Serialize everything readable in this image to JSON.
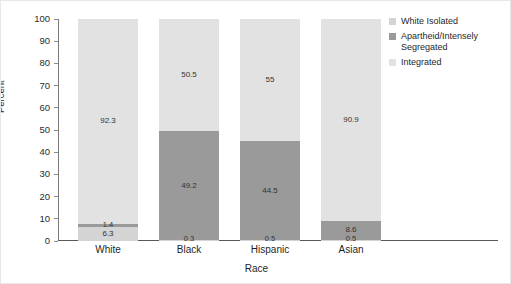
{
  "chart_data": {
    "type": "bar",
    "subtype": "stacked-bar-100",
    "title": "",
    "xlabel": "Race",
    "ylabel": "Percent",
    "ylim": [
      0,
      100
    ],
    "ytick_values": [
      0,
      10,
      20,
      30,
      40,
      50,
      60,
      70,
      80,
      90,
      100
    ],
    "ytick_labels": [
      "0",
      "10",
      "20",
      "30",
      "40",
      "50",
      "60",
      "70",
      "80",
      "90",
      "100"
    ],
    "grid": false,
    "legend_position": "right-top",
    "categories": [
      "White",
      "Black",
      "Hispanic",
      "Asian"
    ],
    "series": [
      {
        "name": "White Isolated",
        "color": "#d4d4d4",
        "values": [
          6.3,
          0.3,
          0.5,
          0.5
        ],
        "labels": [
          "6.3",
          "0.3",
          "0.5",
          "0.5"
        ]
      },
      {
        "name": "Apartheid/Intensely Segregated",
        "color": "#9a9a9a",
        "values": [
          1.4,
          49.2,
          44.5,
          8.6
        ],
        "labels": [
          "1.4",
          "49.2",
          "44.5",
          "8.6"
        ]
      },
      {
        "name": "Integrated",
        "color": "#e2e2e2",
        "values": [
          92.3,
          50.5,
          55.0,
          90.9
        ],
        "labels": [
          "92.3",
          "50.5",
          "55",
          "90.9"
        ]
      }
    ]
  },
  "axes": {
    "y_title": "Percent",
    "x_title": "Race",
    "y_ticks": [
      {
        "label": "100",
        "value": 100
      },
      {
        "label": "90",
        "value": 90
      },
      {
        "label": "80",
        "value": 80
      },
      {
        "label": "70",
        "value": 70
      },
      {
        "label": "60",
        "value": 60
      },
      {
        "label": "50",
        "value": 50
      },
      {
        "label": "40",
        "value": 40
      },
      {
        "label": "30",
        "value": 30
      },
      {
        "label": "20",
        "value": 20
      },
      {
        "label": "10",
        "value": 10
      },
      {
        "label": "0",
        "value": 0
      }
    ],
    "x_categories": [
      {
        "label": "White"
      },
      {
        "label": "Black"
      },
      {
        "label": "Hispanic"
      },
      {
        "label": "Asian"
      }
    ]
  },
  "legend": {
    "items": [
      {
        "label": "White Isolated",
        "color": "#d4d4d4"
      },
      {
        "label": "Apartheid/Intensely Segregated",
        "color": "#9a9a9a"
      },
      {
        "label": "Integrated",
        "color": "#e2e2e2"
      }
    ]
  },
  "bars": [
    {
      "category": "White",
      "segments": [
        {
          "series": "Integrated",
          "value": 92.3,
          "label": "92.3",
          "color": "#e2e2e2"
        },
        {
          "series": "Apartheid",
          "value": 1.4,
          "label": "1.4",
          "color": "#9a9a9a"
        },
        {
          "series": "WhiteIsolated",
          "value": 6.3,
          "label": "6.3",
          "color": "#d4d4d4"
        }
      ]
    },
    {
      "category": "Black",
      "segments": [
        {
          "series": "Integrated",
          "value": 50.5,
          "label": "50.5",
          "color": "#e2e2e2"
        },
        {
          "series": "Apartheid",
          "value": 49.2,
          "label": "49.2",
          "color": "#9a9a9a"
        },
        {
          "series": "WhiteIsolated",
          "value": 0.3,
          "label": "0.3",
          "color": "#d4d4d4"
        }
      ]
    },
    {
      "category": "Hispanic",
      "segments": [
        {
          "series": "Integrated",
          "value": 55.0,
          "label": "55",
          "color": "#e2e2e2"
        },
        {
          "series": "Apartheid",
          "value": 44.5,
          "label": "44.5",
          "color": "#9a9a9a"
        },
        {
          "series": "WhiteIsolated",
          "value": 0.5,
          "label": "0.5",
          "color": "#d4d4d4"
        }
      ]
    },
    {
      "category": "Asian",
      "segments": [
        {
          "series": "Integrated",
          "value": 90.9,
          "label": "90.9",
          "color": "#e2e2e2"
        },
        {
          "series": "Apartheid",
          "value": 8.6,
          "label": "8.6",
          "color": "#9a9a9a"
        },
        {
          "series": "WhiteIsolated",
          "value": 0.5,
          "label": "0.5",
          "color": "#d4d4d4"
        }
      ]
    }
  ]
}
